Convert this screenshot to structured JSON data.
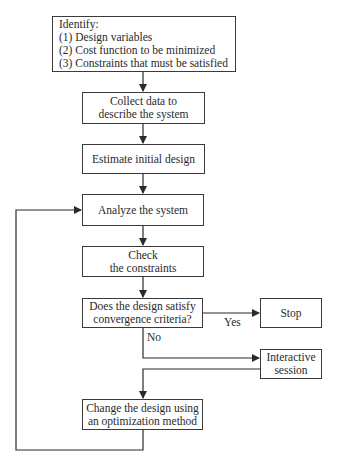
{
  "flowchart": {
    "identify": {
      "title": "Identify:",
      "items": [
        "(1)  Design variables",
        "(2)  Cost function to be minimized",
        "(3)  Constraints that must be satisfied"
      ]
    },
    "collect": {
      "line1": "Collect data to",
      "line2": "describe the system"
    },
    "estimate": {
      "line1": "Estimate initial design"
    },
    "analyze": {
      "line1": "Analyze the system"
    },
    "check": {
      "line1": "Check",
      "line2": "the constraints"
    },
    "decision": {
      "line1": "Does the design satisfy",
      "line2": "convergence criteria?"
    },
    "stop": {
      "line1": "Stop"
    },
    "interactive": {
      "line1": "Interactive",
      "line2": "session"
    },
    "change": {
      "line1": "Change the design using",
      "line2": "an optimization method"
    },
    "edge_labels": {
      "yes": "Yes",
      "no": "No"
    }
  }
}
